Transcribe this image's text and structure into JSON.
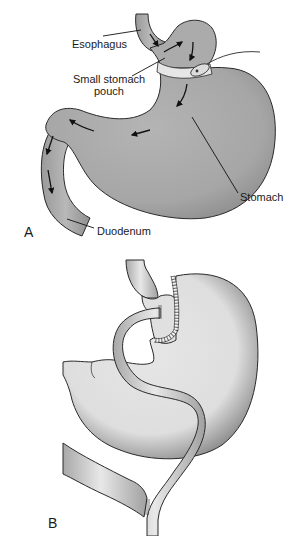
{
  "figure": {
    "panel_a": {
      "letter": "A",
      "labels": {
        "esophagus": "Esophagus",
        "pouch_line1": "Small stomach",
        "pouch_line2": "pouch",
        "stomach": "Stomach",
        "duodenum": "Duodenum"
      },
      "colors": {
        "stomach_fill": "#a9a9a9",
        "stomach_shade": "#8c8c8c",
        "band": "#e6e6e6",
        "outline": "#2a2a2a"
      }
    },
    "panel_b": {
      "letter": "B",
      "colors": {
        "stomach_fill": "#e2e2e2",
        "stomach_shade": "#9a9a9a",
        "limb_fill": "#d6d6d6",
        "outline": "#2a2a2a"
      }
    }
  }
}
